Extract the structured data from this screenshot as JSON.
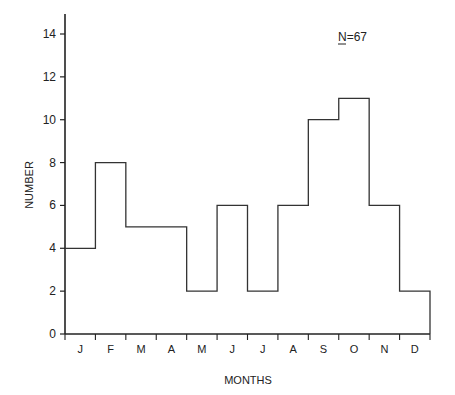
{
  "chart_data": {
    "type": "bar",
    "style": "step-histogram",
    "title": "",
    "annotation": "N=67",
    "xlabel": "MONTHS",
    "ylabel": "NUMBER",
    "categories": [
      "J",
      "F",
      "M",
      "A",
      "M",
      "J",
      "J",
      "A",
      "S",
      "O",
      "N",
      "D"
    ],
    "values": [
      4,
      8,
      5,
      5,
      2,
      6,
      2,
      6,
      10,
      11,
      6,
      2
    ],
    "ylim": [
      0,
      14
    ],
    "yticks": [
      0,
      2,
      4,
      6,
      8,
      10,
      12,
      14
    ],
    "grid": false,
    "legend": null
  }
}
